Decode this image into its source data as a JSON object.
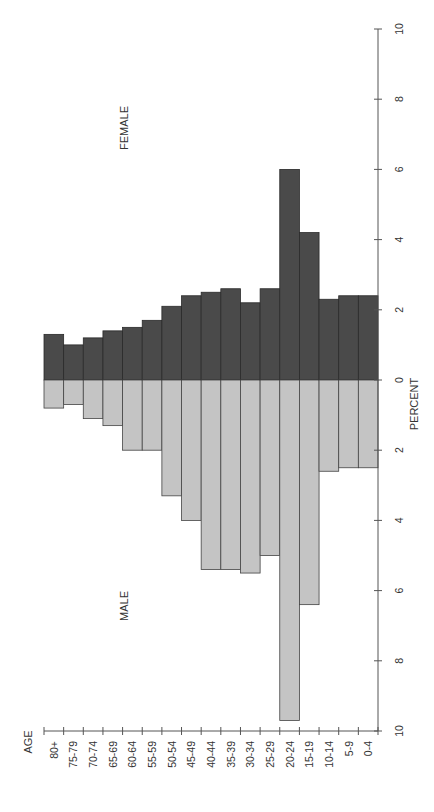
{
  "chart_data": {
    "type": "bar",
    "subtype": "population-pyramid",
    "orientation": "rotated-90-ccw",
    "title": "",
    "xlabel": "AGE",
    "ylabel": "PERCENT",
    "categories": [
      "80+",
      "75-79",
      "70-74",
      "65-69",
      "60-64",
      "55-59",
      "50-54",
      "45-49",
      "40-44",
      "35-39",
      "30-34",
      "25-29",
      "20-24",
      "15-19",
      "10-14",
      "5-9",
      "0-4"
    ],
    "series": [
      {
        "name": "FEMALE",
        "color": "#4a4a4a",
        "values": [
          1.3,
          1.0,
          1.2,
          1.4,
          1.5,
          1.7,
          2.1,
          2.4,
          2.5,
          2.6,
          2.2,
          2.6,
          6.0,
          4.2,
          2.3,
          2.4,
          2.4
        ]
      },
      {
        "name": "MALE",
        "color": "#c4c4c4",
        "values": [
          0.8,
          0.7,
          1.1,
          1.3,
          2.0,
          2.0,
          3.3,
          4.0,
          5.4,
          5.4,
          5.5,
          5.0,
          9.7,
          6.4,
          2.6,
          2.5,
          2.5
        ]
      }
    ],
    "percent_ticks": [
      "10",
      "8",
      "6",
      "4",
      "2",
      "0",
      "2",
      "4",
      "6",
      "8",
      "10"
    ],
    "ylim": [
      -10,
      10
    ],
    "grid": false,
    "legend": "inline labels (FEMALE, MALE)"
  },
  "labels": {
    "female": "FEMALE",
    "male": "MALE",
    "age_axis": "AGE",
    "percent_axis": "PERCENT"
  }
}
